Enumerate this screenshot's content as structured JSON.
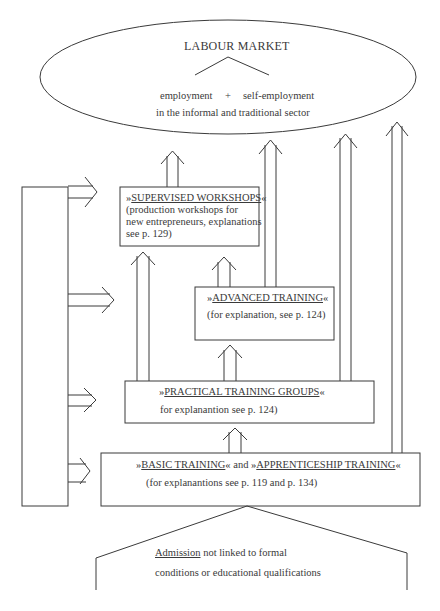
{
  "header_fragment": "y ... ... g",
  "labour_market": {
    "title": "LABOUR MARKET",
    "employment": "employment",
    "plus": "+",
    "self_employment": "self-employment",
    "sector": "in the informal and traditional sector"
  },
  "supervised_workshops": {
    "prefix": "»",
    "name": "SUPERVISED WORKSHOPS",
    "suffix": "«",
    "line1": "(production workshops for",
    "line2": "new entrepreneurs, explanations",
    "line3": "see p. 129)"
  },
  "advanced_training": {
    "prefix": "»",
    "name": "ADVANCED TRAINING",
    "suffix": "«",
    "note": "(for explanation, see p. 124)"
  },
  "practical_training": {
    "prefix": "»",
    "name": "PRACTICAL TRAINING GROUPS",
    "suffix": "«",
    "note": "for explanantion see p. 124)"
  },
  "basic_training": {
    "prefix1": "»",
    "name1": "BASIC TRAINING",
    "mid": "« and »",
    "name2": "APPRENTICESHIP TRAINING",
    "suffix": "«",
    "note": "(for explanantions see p. 119 and p. 134)"
  },
  "admission": {
    "word": "Admission",
    "rest": " not linked to formal",
    "line2": "conditions or educational qualifications"
  },
  "colors": {
    "stroke": "#3a3a3a",
    "background": "#ffffff"
  }
}
